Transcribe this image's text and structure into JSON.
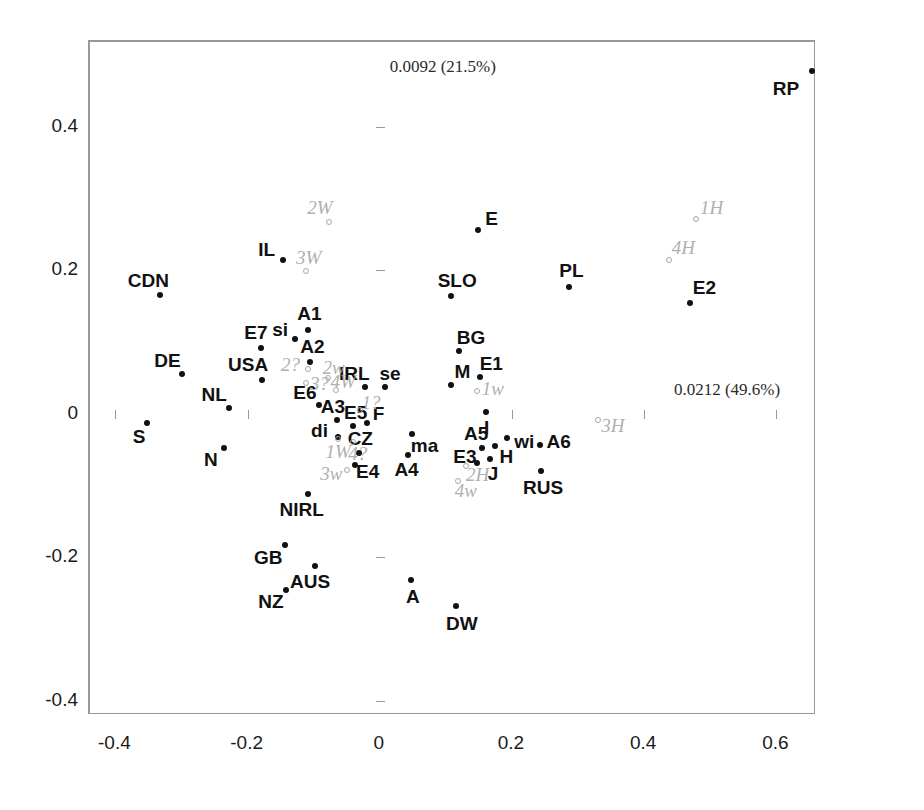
{
  "chart_data": {
    "type": "scatter",
    "title": "",
    "xlabel": "",
    "ylabel": "",
    "xlim": [
      -0.44,
      0.66
    ],
    "ylim": [
      -0.42,
      0.52
    ],
    "grid": false,
    "legend": "none",
    "annotations": [
      {
        "text": "0.0092 (21.5%)",
        "x": 0.015,
        "y": 0.485,
        "name": "axis2-variance-annotation"
      },
      {
        "text": "0.0212 (49.6%)",
        "x": 0.445,
        "y": 0.035,
        "name": "axis1-variance-annotation"
      }
    ],
    "xticks": [
      -0.4,
      -0.2,
      0,
      0.2,
      0.4,
      0.6
    ],
    "xticklabels": [
      "-0.4",
      "-0.2",
      "0",
      "0.2",
      "0.4",
      "0.6"
    ],
    "yticks": [
      -0.4,
      -0.2,
      0,
      0.2,
      0.4
    ],
    "yticklabels": [
      "-0.4",
      "-0.2",
      "0",
      "0.2",
      "0.4"
    ],
    "series": [
      {
        "name": "filled-black-points",
        "marker": "filled-circle",
        "color": "#111111",
        "points": [
          {
            "label": "RP",
            "x": 0.654,
            "y": 0.478,
            "lx": -26,
            "ly": 18
          },
          {
            "label": "E",
            "x": 0.148,
            "y": 0.257,
            "lx": 14,
            "ly": -11
          },
          {
            "label": "SLO",
            "x": 0.108,
            "y": 0.164,
            "lx": 6,
            "ly": -15
          },
          {
            "label": "PL",
            "x": 0.287,
            "y": 0.177,
            "lx": 2,
            "ly": -16
          },
          {
            "label": "E2",
            "x": 0.47,
            "y": 0.155,
            "lx": 14,
            "ly": -15
          },
          {
            "label": "IL",
            "x": -0.147,
            "y": 0.215,
            "lx": -16,
            "ly": -10
          },
          {
            "label": "CDN",
            "x": -0.332,
            "y": 0.166,
            "lx": -12,
            "ly": -14
          },
          {
            "label": "A1",
            "x": -0.108,
            "y": 0.117,
            "lx": 1,
            "ly": -16
          },
          {
            "label": "si",
            "x": -0.128,
            "y": 0.104,
            "lx": -15,
            "ly": -9
          },
          {
            "label": "E7",
            "x": -0.18,
            "y": 0.092,
            "lx": -5,
            "ly": -15
          },
          {
            "label": "DE",
            "x": -0.3,
            "y": 0.055,
            "lx": -14,
            "ly": -13
          },
          {
            "label": "USA",
            "x": -0.178,
            "y": 0.047,
            "lx": -14,
            "ly": -15
          },
          {
            "label": "A2",
            "x": -0.105,
            "y": 0.072,
            "lx": 2,
            "ly": -15
          },
          {
            "label": "BG",
            "x": 0.12,
            "y": 0.088,
            "lx": 12,
            "ly": -13
          },
          {
            "label": "IRL",
            "x": -0.022,
            "y": 0.038,
            "lx": -11,
            "ly": -13
          },
          {
            "label": "se",
            "x": 0.008,
            "y": 0.037,
            "lx": 5,
            "ly": -13
          },
          {
            "label": "M",
            "x": 0.107,
            "y": 0.04,
            "lx": 12,
            "ly": -13
          },
          {
            "label": "E1",
            "x": 0.152,
            "y": 0.052,
            "lx": 11,
            "ly": -13
          },
          {
            "label": "NL",
            "x": -0.228,
            "y": 0.008,
            "lx": -15,
            "ly": -13
          },
          {
            "label": "E6",
            "x": -0.092,
            "y": 0.013,
            "lx": -14,
            "ly": -12
          },
          {
            "label": "A3",
            "x": -0.065,
            "y": -0.008,
            "lx": -4,
            "ly": -13
          },
          {
            "label": "E5",
            "x": -0.041,
            "y": -0.017,
            "lx": 3,
            "ly": -13
          },
          {
            "label": "F",
            "x": -0.02,
            "y": -0.013,
            "lx": 12,
            "ly": -9
          },
          {
            "label": "di",
            "x": -0.064,
            "y": -0.032,
            "lx": -18,
            "ly": -6
          },
          {
            "label": "S",
            "x": -0.352,
            "y": -0.013,
            "lx": -8,
            "ly": 14
          },
          {
            "label": "I",
            "x": 0.16,
            "y": 0.003,
            "lx": 1,
            "ly": 16
          },
          {
            "label": "ma",
            "x": 0.048,
            "y": -0.028,
            "lx": 13,
            "ly": 12
          },
          {
            "label": "wi",
            "x": 0.193,
            "y": -0.033,
            "lx": 17,
            "ly": 4
          },
          {
            "label": "A6",
            "x": 0.242,
            "y": -0.043,
            "lx": 19,
            "ly": -3
          },
          {
            "label": "A5",
            "x": 0.155,
            "y": -0.048,
            "lx": -6,
            "ly": -14
          },
          {
            "label": "H",
            "x": 0.175,
            "y": -0.045,
            "lx": 11,
            "ly": 11
          },
          {
            "label": "E3",
            "x": 0.147,
            "y": -0.068,
            "lx": -12,
            "ly": -6
          },
          {
            "label": "J",
            "x": 0.167,
            "y": -0.063,
            "lx": 3,
            "ly": 15
          },
          {
            "label": "CZ",
            "x": -0.031,
            "y": -0.055,
            "lx": 1,
            "ly": -14
          },
          {
            "label": "A4",
            "x": 0.042,
            "y": -0.057,
            "lx": -1,
            "ly": 15
          },
          {
            "label": "E4",
            "x": -0.038,
            "y": -0.072,
            "lx": 13,
            "ly": 7
          },
          {
            "label": "N",
            "x": -0.236,
            "y": -0.047,
            "lx": -13,
            "ly": 12
          },
          {
            "label": "RUS",
            "x": 0.244,
            "y": -0.08,
            "lx": 2,
            "ly": 17
          },
          {
            "label": "NIRL",
            "x": -0.109,
            "y": -0.112,
            "lx": -6,
            "ly": 16
          },
          {
            "label": "GB",
            "x": -0.143,
            "y": -0.183,
            "lx": -17,
            "ly": 13
          },
          {
            "label": "AUS",
            "x": -0.098,
            "y": -0.212,
            "lx": -5,
            "ly": 16
          },
          {
            "label": "NZ",
            "x": -0.142,
            "y": -0.245,
            "lx": -15,
            "ly": 12
          },
          {
            "label": "A",
            "x": 0.047,
            "y": -0.232,
            "lx": 2,
            "ly": 17
          },
          {
            "label": "DW",
            "x": 0.115,
            "y": -0.268,
            "lx": 6,
            "ly": 18
          }
        ]
      },
      {
        "name": "open-grey-points",
        "marker": "open-circle",
        "color": "#b0b0b0",
        "points": [
          {
            "label": "2W",
            "x": -0.077,
            "y": 0.268,
            "lx": -9,
            "ly": -14
          },
          {
            "label": "3W",
            "x": -0.112,
            "y": 0.199,
            "lx": 3,
            "ly": -13
          },
          {
            "label": "1H",
            "x": 0.478,
            "y": 0.272,
            "lx": 16,
            "ly": -11
          },
          {
            "label": "4H",
            "x": 0.438,
            "y": 0.215,
            "lx": 14,
            "ly": -12
          },
          {
            "label": "2?",
            "x": -0.108,
            "y": 0.062,
            "lx": -18,
            "ly": -4
          },
          {
            "label": "2w",
            "x": -0.079,
            "y": 0.05,
            "lx": 6,
            "ly": -10
          },
          {
            "label": "3?",
            "x": -0.111,
            "y": 0.043,
            "lx": 13,
            "ly": 1
          },
          {
            "label": "4W",
            "x": -0.066,
            "y": 0.033,
            "lx": 7,
            "ly": -8
          },
          {
            "label": "1?",
            "x": -0.03,
            "y": 0.006,
            "lx": 11,
            "ly": -7
          },
          {
            "label": "1W",
            "x": -0.063,
            "y": -0.035,
            "lx": 0,
            "ly": 13
          },
          {
            "label": "4?",
            "x": -0.041,
            "y": -0.039,
            "lx": 5,
            "ly": 12
          },
          {
            "label": "3w",
            "x": -0.049,
            "y": -0.078,
            "lx": -16,
            "ly": 4
          },
          {
            "label": "1w",
            "x": 0.147,
            "y": 0.032,
            "lx": 16,
            "ly": -2
          },
          {
            "label": "3H",
            "x": 0.33,
            "y": -0.008,
            "lx": 15,
            "ly": 6
          },
          {
            "label": "2H",
            "x": 0.13,
            "y": -0.073,
            "lx": 12,
            "ly": 9
          },
          {
            "label": "4w",
            "x": 0.118,
            "y": -0.094,
            "lx": 8,
            "ly": 10
          }
        ]
      }
    ]
  }
}
